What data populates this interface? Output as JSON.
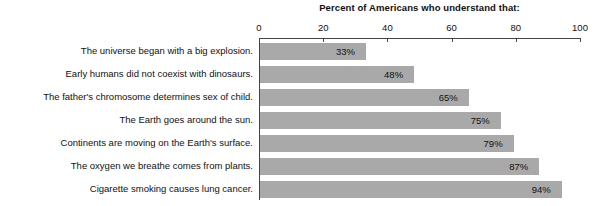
{
  "chart_data": {
    "type": "bar",
    "orientation": "horizontal",
    "title": "Percent of Americans who understand that:",
    "xlabel": "",
    "ylabel": "",
    "xlim": [
      0,
      100
    ],
    "xticks": [
      0,
      20,
      40,
      60,
      80,
      100
    ],
    "xtick_labels": [
      "0",
      "20",
      "40",
      "60",
      "80",
      "100"
    ],
    "grid": false,
    "legend": null,
    "bar_color": "#a9a9a9",
    "axis_color": "#444444",
    "text_color": "#111111",
    "value_suffix": "%",
    "categories": [
      "The universe began with a big explosion.",
      "Early humans did not coexist with dinosaurs.",
      "The father's chromosome determines sex of child.",
      "The Earth goes around the sun.",
      "Continents are moving on the Earth's surface.",
      "The oxygen we breathe comes from plants.",
      "Cigarette smoking causes lung cancer."
    ],
    "values": [
      33,
      48,
      65,
      75,
      79,
      87,
      94
    ],
    "value_labels": [
      "33%",
      "48%",
      "65%",
      "75%",
      "79%",
      "87%",
      "94%"
    ]
  }
}
